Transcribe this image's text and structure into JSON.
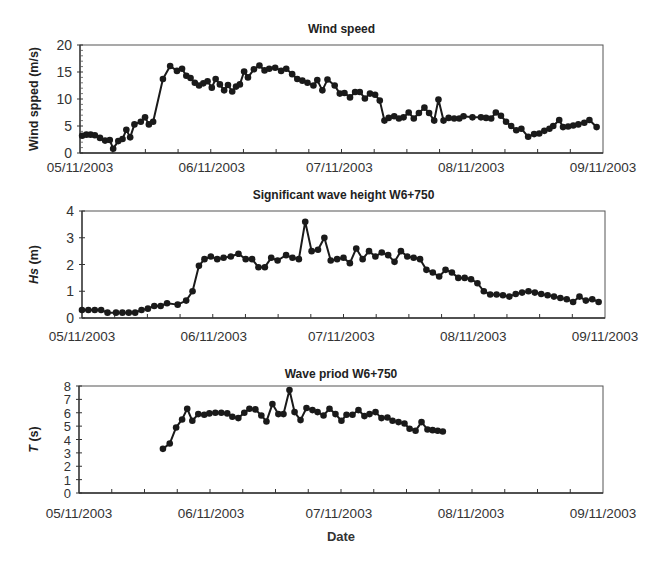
{
  "figure": {
    "x_tick_labels": [
      "05/11/2003",
      "06/11/2003",
      "07/11/2003",
      "08/11/2003",
      "09/11/2003"
    ],
    "x_tick_days": [
      0,
      31,
      61,
      92,
      123
    ],
    "x_minor_tick_step_days": 7.6875,
    "x_domain_days": [
      0,
      123
    ],
    "bottom_xlabel": "Date",
    "line_color": "#1a1a1a",
    "frame_color": "#555555"
  },
  "chart_data": [
    {
      "type": "line",
      "title": "Wind speed",
      "xlabel": "",
      "ylabel": "Wind spped (m/s)",
      "ylim": [
        0,
        20
      ],
      "y_ticks": [
        0,
        5,
        10,
        15,
        20
      ],
      "x_tick_labels": [
        "05/11/2003",
        "06/11/2003",
        "07/11/2003",
        "08/11/2003",
        "09/11/2003"
      ],
      "grid": false,
      "legend": "none",
      "series": [
        {
          "name": "Wind speed",
          "x_days": [
            0.5,
            1.5,
            2.5,
            3.5,
            4.7,
            5.9,
            7.0,
            7.8,
            9.0,
            10.0,
            10.9,
            11.8,
            12.8,
            14.3,
            15.3,
            16.2,
            17.2,
            19.5,
            21.2,
            22.8,
            24.0,
            25.0,
            26.0,
            27.0,
            28.0,
            29.0,
            30.0,
            31.0,
            31.9,
            32.9,
            33.9,
            34.8,
            35.8,
            36.7,
            37.6,
            38.6,
            39.5,
            40.9,
            42.2,
            43.4,
            44.5,
            45.9,
            47.3,
            48.5,
            49.9,
            51.1,
            52.3,
            53.5,
            54.9,
            55.8,
            57.0,
            58.2,
            59.9,
            61.1,
            62.2,
            63.5,
            64.7,
            65.8,
            67.0,
            68.2,
            69.4,
            70.5,
            71.6,
            72.6,
            73.9,
            75.0,
            76.1,
            77.3,
            78.5,
            79.7,
            81.0,
            82.1,
            83.3,
            84.3,
            85.5,
            86.7,
            88.0,
            89.2,
            90.2,
            92.3,
            94.3,
            95.5,
            96.7,
            97.8,
            99.0,
            100.2,
            101.4,
            102.6,
            103.8,
            105.4,
            106.8,
            108.0,
            109.2,
            110.4,
            111.3,
            112.7,
            113.6,
            114.8,
            116.0,
            117.2,
            118.6,
            119.8,
            121.5
          ],
          "values": [
            3.2,
            3.4,
            3.4,
            3.3,
            2.8,
            2.3,
            2.4,
            0.8,
            2.2,
            2.6,
            4.3,
            2.9,
            5.3,
            5.8,
            6.6,
            5.3,
            5.8,
            13.7,
            16.1,
            15.2,
            15.6,
            14.3,
            13.9,
            13.0,
            12.5,
            12.9,
            13.3,
            12.1,
            13.7,
            12.7,
            11.6,
            12.6,
            11.4,
            12.3,
            12.7,
            15.1,
            14.0,
            15.5,
            16.2,
            15.3,
            15.6,
            15.8,
            15.2,
            15.6,
            14.6,
            13.7,
            13.4,
            13.0,
            12.5,
            13.5,
            11.6,
            13.6,
            12.5,
            11.0,
            11.1,
            10.3,
            11.3,
            11.3,
            10.1,
            11.0,
            10.8,
            9.7,
            6.0,
            6.5,
            6.8,
            6.4,
            6.6,
            7.5,
            6.4,
            7.4,
            8.4,
            7.4,
            6.0,
            9.9,
            6.0,
            6.5,
            6.4,
            6.4,
            6.8,
            6.6,
            6.6,
            6.5,
            6.4,
            7.5,
            6.9,
            5.8,
            5.0,
            4.2,
            4.5,
            3.0,
            3.5,
            3.6,
            4.1,
            4.5,
            5.0,
            6.1,
            4.8,
            4.9,
            5.1,
            5.3,
            5.6,
            6.1,
            4.8
          ]
        }
      ]
    },
    {
      "type": "line",
      "title": "Significant wave height W6+750",
      "xlabel": "",
      "ylabel": "Hs (m)",
      "ylim": [
        0,
        4
      ],
      "y_ticks": [
        0,
        1,
        2,
        3,
        4
      ],
      "x_tick_labels": [
        "05/11/2003",
        "06/11/2003",
        "07/11/2003",
        "08/11/2003",
        "09/11/2003"
      ],
      "grid": false,
      "legend": "none",
      "series": [
        {
          "name": "Hs",
          "x_days": [
            0,
            1.5,
            3,
            4.5,
            6,
            8,
            9.5,
            11,
            12.5,
            14,
            15.5,
            17,
            18.5,
            20,
            22.5,
            24.5,
            26,
            27.5,
            28.8,
            30.3,
            31.8,
            33.3,
            35,
            36.8,
            38.5,
            40,
            41.5,
            43,
            44.5,
            46,
            48,
            49.5,
            51,
            52.5,
            54,
            55.5,
            57,
            58.5,
            60,
            61.5,
            63,
            64.5,
            66,
            67.5,
            69,
            70.5,
            72,
            73.5,
            75,
            76.5,
            78,
            79.5,
            81,
            82.5,
            84,
            85.5,
            87,
            88.5,
            90,
            91.5,
            93,
            94.5,
            96,
            97.5,
            99,
            100.5,
            102,
            103.5,
            105,
            106.5,
            108,
            109.5,
            111,
            112.5,
            114,
            115.5,
            117,
            118.5,
            120,
            121.5
          ],
          "values": [
            0.3,
            0.3,
            0.3,
            0.3,
            0.2,
            0.2,
            0.2,
            0.2,
            0.2,
            0.3,
            0.35,
            0.45,
            0.45,
            0.55,
            0.5,
            0.65,
            1.0,
            1.95,
            2.2,
            2.3,
            2.2,
            2.25,
            2.3,
            2.4,
            2.2,
            2.2,
            1.9,
            1.9,
            2.25,
            2.15,
            2.35,
            2.25,
            2.2,
            3.6,
            2.5,
            2.55,
            3.0,
            2.15,
            2.2,
            2.25,
            2.05,
            2.6,
            2.2,
            2.5,
            2.3,
            2.45,
            2.35,
            2.1,
            2.5,
            2.3,
            2.25,
            2.2,
            1.8,
            1.7,
            1.55,
            1.8,
            1.7,
            1.5,
            1.5,
            1.45,
            1.3,
            1.0,
            0.88,
            0.88,
            0.85,
            0.8,
            0.9,
            0.95,
            1.0,
            0.95,
            0.9,
            0.85,
            0.8,
            0.75,
            0.7,
            0.6,
            0.8,
            0.65,
            0.7,
            0.6,
            0.55,
            0.4,
            0.38,
            0.4,
            0.45,
            0.65
          ]
        }
      ]
    },
    {
      "type": "line",
      "title": "Wave priod W6+750",
      "xlabel": "Date",
      "ylabel": "T (s)",
      "ylim": [
        0,
        8
      ],
      "y_ticks": [
        0,
        1,
        2,
        3,
        4,
        5,
        6,
        7,
        8
      ],
      "x_tick_labels": [
        "05/11/2003",
        "06/11/2003",
        "07/11/2003",
        "08/11/2003",
        "09/11/2003"
      ],
      "grid": false,
      "legend": "none",
      "series": [
        {
          "name": "T",
          "x_days": [
            19.7,
            21.3,
            22.8,
            24.2,
            25.4,
            26.6,
            28.0,
            29.4,
            30.6,
            32.0,
            33.4,
            34.8,
            36.0,
            37.4,
            38.8,
            40.0,
            41.4,
            42.8,
            44.0,
            45.4,
            46.8,
            48.0,
            49.4,
            50.6,
            52.0,
            53.4,
            54.8,
            56.0,
            57.4,
            58.8,
            60.2,
            61.6,
            62.8,
            64.2,
            65.6,
            67.0,
            68.2,
            69.6,
            71.0,
            72.4,
            73.6,
            75.0,
            76.4,
            77.6,
            79.0,
            80.4,
            81.8,
            83.0,
            84.2,
            85.4
          ],
          "values": [
            3.3,
            3.7,
            4.9,
            5.5,
            6.3,
            5.4,
            5.9,
            5.85,
            5.95,
            6.0,
            6.0,
            5.95,
            5.7,
            5.6,
            6.0,
            6.3,
            6.25,
            5.8,
            5.35,
            6.65,
            5.9,
            5.9,
            7.7,
            6.05,
            5.45,
            6.35,
            6.2,
            6.05,
            5.8,
            6.3,
            5.9,
            5.4,
            5.85,
            5.85,
            6.2,
            5.75,
            5.9,
            6.05,
            5.6,
            5.65,
            5.4,
            5.3,
            5.2,
            4.8,
            4.65,
            5.3,
            4.75,
            4.7,
            4.65,
            4.6
          ]
        }
      ]
    }
  ],
  "layout_hints": {
    "panels": [
      {
        "left": 80,
        "right": 603,
        "top": 45,
        "bottom": 153,
        "title_y": 33,
        "tick_label_y": 172
      },
      {
        "left": 82,
        "right": 605,
        "top": 211,
        "bottom": 318,
        "title_y": 199,
        "tick_label_y": 341
      },
      {
        "left": 79,
        "right": 603,
        "top": 386,
        "bottom": 493,
        "title_y": 378,
        "tick_label_y": 518
      }
    ],
    "date_label_y": 541
  }
}
